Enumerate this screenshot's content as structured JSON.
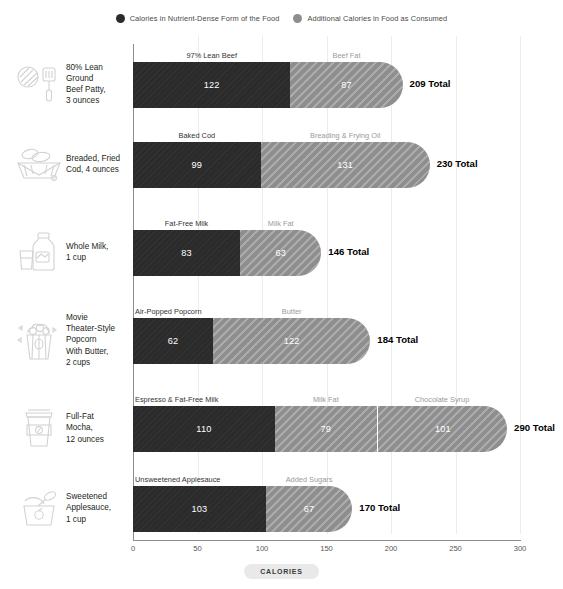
{
  "legend": {
    "items": [
      {
        "label": "Calories in Nutrient-Dense Form of the Food",
        "color": "#2b2b2b",
        "icon": "dark-circle-icon"
      },
      {
        "label": "Additional Calories in Food as Consumed",
        "color": "#8e8e8e",
        "icon": "light-circle-icon"
      }
    ]
  },
  "axis": {
    "title": "CALORIES",
    "ticks": [
      "0",
      "50",
      "100",
      "150",
      "200",
      "250",
      "300"
    ]
  },
  "chart_data": {
    "type": "bar",
    "title": "",
    "subtitle": "",
    "xlabel": "CALORIES",
    "ylabel": "",
    "xlim": [
      0,
      300
    ],
    "xticks": [
      0,
      50,
      100,
      150,
      200,
      250,
      300
    ],
    "grid": true,
    "orientation": "horizontal",
    "stacked": true,
    "legend_position": "top-center",
    "legend": [
      "Calories in Nutrient-Dense Form of the Food",
      "Additional Calories in Food as Consumed"
    ],
    "categories": [
      "80% Lean Ground Beef Patty, 3 ounces",
      "Breaded, Fried Cod, 4 ounces",
      "Whole Milk, 1 cup",
      "Movie Theater-Style Popcorn With Butter, 2 cups",
      "Full-Fat Mocha, 12 ounces",
      "Sweetened Applesauce, 1 cup"
    ],
    "series": [
      {
        "name": "Calories in Nutrient-Dense Form of the Food",
        "values": [
          122,
          99,
          83,
          62,
          110,
          103
        ]
      },
      {
        "name": "Additional Calories in Food as Consumed",
        "values": [
          87,
          131,
          63,
          122,
          180,
          67
        ]
      }
    ],
    "totals": [
      209,
      230,
      146,
      184,
      290,
      170
    ]
  },
  "rows": [
    {
      "name": "80% Lean\nGround\nBeef Patty,\n3 ounces",
      "icon": "beef-patty-spatula-icon",
      "total_label": "209 Total",
      "total": 209,
      "segments": [
        {
          "caption": "97% Lean Beef",
          "value": "122",
          "amount": 122,
          "kind": "dark"
        },
        {
          "caption": "Beef Fat",
          "value": "87",
          "amount": 87,
          "kind": "light"
        }
      ]
    },
    {
      "name": "Breaded, Fried\nCod, 4 ounces",
      "icon": "fried-fish-basket-icon",
      "total_label": "230 Total",
      "total": 230,
      "segments": [
        {
          "caption": "Baked Cod",
          "value": "99",
          "amount": 99,
          "kind": "dark"
        },
        {
          "caption": "Breading & Frying Oil",
          "value": "131",
          "amount": 131,
          "kind": "light"
        }
      ]
    },
    {
      "name": "Whole Milk,\n1 cup",
      "icon": "milk-jug-glass-icon",
      "total_label": "146 Total",
      "total": 146,
      "segments": [
        {
          "caption": "Fat-Free Milk",
          "value": "83",
          "amount": 83,
          "kind": "dark"
        },
        {
          "caption": "Milk Fat",
          "value": "63",
          "amount": 63,
          "kind": "light"
        }
      ]
    },
    {
      "name": "Movie\nTheater-Style\nPopcorn\nWith Butter,\n2 cups",
      "icon": "popcorn-bucket-icon",
      "total_label": "184 Total",
      "total": 184,
      "segments": [
        {
          "caption": "Air-Popped Popcorn",
          "value": "62",
          "amount": 62,
          "kind": "dark"
        },
        {
          "caption": "Butter",
          "value": "122",
          "amount": 122,
          "kind": "light"
        }
      ]
    },
    {
      "name": "Full-Fat\nMocha,\n12 ounces",
      "icon": "coffee-cup-icon",
      "total_label": "290 Total",
      "total": 290,
      "segments": [
        {
          "caption": "Espresso & Fat-Free Milk",
          "value": "110",
          "amount": 110,
          "kind": "dark"
        },
        {
          "caption": "Milk Fat",
          "value": "79",
          "amount": 79,
          "kind": "light"
        },
        {
          "caption": "Chocolate Syrup",
          "value": "101",
          "amount": 101,
          "kind": "light",
          "divided": true
        }
      ]
    },
    {
      "name": "Sweetened\nApplesauce,\n1 cup",
      "icon": "applesauce-bowl-spoon-icon",
      "total_label": "170 Total",
      "total": 170,
      "segments": [
        {
          "caption": "Unsweetened Applesauce",
          "value": "103",
          "amount": 103,
          "kind": "dark"
        },
        {
          "caption": "Added Sugars",
          "value": "67",
          "amount": 67,
          "kind": "light"
        }
      ]
    }
  ]
}
